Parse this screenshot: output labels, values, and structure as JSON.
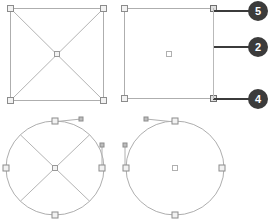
{
  "figure": {
    "type": "cad-selection-diagram",
    "background_color": "#ffffff",
    "geometry_color": "#a8a8a8",
    "handle_fill": "#f2f2f2",
    "handle_stroke": "#8c8c8c",
    "leader_color": "#3b3b3b",
    "badge_color": "#3b3b3b",
    "badge_text_color": "#ffffff"
  },
  "callouts": [
    {
      "label": "5",
      "cx": 258,
      "cy": 11,
      "leader_from_x": 214,
      "leader_from_y": 11
    },
    {
      "label": "2",
      "cx": 258,
      "cy": 47,
      "leader_from_x": 214,
      "leader_from_y": 47
    },
    {
      "label": "4",
      "cx": 258,
      "cy": 99,
      "leader_from_x": 214,
      "leader_from_y": 99
    }
  ],
  "shapes": [
    {
      "name": "square-with-diagonals",
      "kind": "square",
      "x": 10,
      "y": 8,
      "width": 94,
      "height": 93,
      "diagonals": true,
      "handles": [
        "top-left",
        "top-right",
        "bottom-left",
        "bottom-right",
        "center"
      ]
    },
    {
      "name": "square-plain",
      "kind": "square",
      "x": 124,
      "y": 8,
      "width": 90,
      "height": 91,
      "diagonals": false,
      "handles": [
        "top-left",
        "top-right",
        "bottom-left",
        "bottom-right",
        "center"
      ]
    },
    {
      "name": "circle-with-diagonals",
      "kind": "circle",
      "cx": 55,
      "cy": 168,
      "rx": 49,
      "ry": 47,
      "diagonals": true,
      "handles": [
        "top",
        "bottom",
        "left",
        "right",
        "center"
      ],
      "tangent_lines": [
        "top-horizontal",
        "right-vertical"
      ]
    },
    {
      "name": "circle-plain",
      "kind": "circle",
      "cx": 175,
      "cy": 168,
      "rx": 49,
      "ry": 47,
      "diagonals": false,
      "handles": [
        "top",
        "bottom",
        "left",
        "right",
        "center"
      ],
      "tangent_lines": [
        "top-horizontal",
        "left-vertical"
      ]
    }
  ]
}
